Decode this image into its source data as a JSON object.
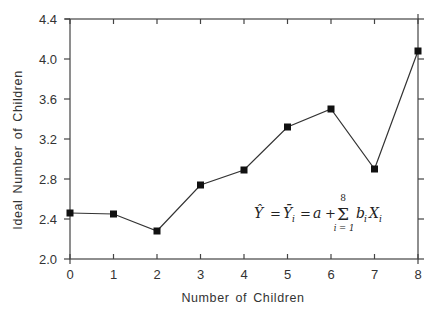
{
  "chart_data": {
    "type": "line",
    "title": "",
    "xlabel": "Number of Children",
    "ylabel": "Ideal Number of Children",
    "x": [
      0,
      1,
      2,
      3,
      4,
      5,
      6,
      7,
      8
    ],
    "series": [
      {
        "name": "Ideal Number of Children",
        "marker": "square",
        "values": [
          2.46,
          2.45,
          2.28,
          2.74,
          2.89,
          3.32,
          3.5,
          2.9,
          4.08
        ]
      }
    ],
    "xlim": [
      0,
      8
    ],
    "ylim": [
      2.0,
      4.4
    ],
    "xticks": [
      0,
      1,
      2,
      3,
      4,
      5,
      6,
      7,
      8
    ],
    "yticks": [
      2.0,
      2.4,
      2.8,
      3.2,
      3.6,
      4.0,
      4.4
    ],
    "ytick_labels": [
      "2.0",
      "2.4",
      "2.8",
      "3.2",
      "3.6",
      "4.0",
      "4.4"
    ],
    "grid": false,
    "legend": "none",
    "annotations": [
      {
        "text": "Ŷ = Ȳi = a + Σ(i=1..8) bi Xi",
        "x": 5.8,
        "y": 2.55
      }
    ]
  },
  "formula": {
    "lhs": "Ŷ",
    "eq1": "=",
    "mid": "Ȳ",
    "mid_sub": "i",
    "eq2": "=",
    "a": "a",
    "plus": "+",
    "sigma": "Σ",
    "sigma_top": "8",
    "sigma_bottom": "i = 1",
    "b": "b",
    "b_sub": "i",
    "x": "X",
    "x_sub": "i"
  },
  "colors": {
    "line": "#333333",
    "marker": "#111111",
    "axis": "#444444",
    "background": "#ffffff"
  }
}
